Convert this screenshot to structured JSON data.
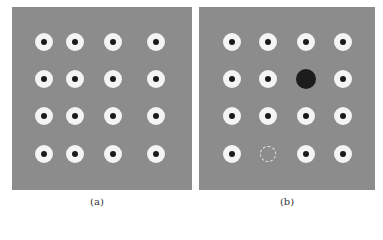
{
  "figure": {
    "panels": [
      {
        "id": "a",
        "caption": "(a)",
        "box": {
          "x": 12,
          "y": 7,
          "w": 180,
          "h": 183
        },
        "columns": [
          44,
          75,
          113,
          156
        ],
        "rows": [
          42,
          79,
          116,
          154
        ],
        "markers": "4x4 grid of white rings with black centers"
      },
      {
        "id": "b",
        "caption": "(b)",
        "box": {
          "x": 199,
          "y": 7,
          "w": 176,
          "h": 183
        },
        "columns": [
          232,
          268,
          306,
          343
        ],
        "rows": [
          42,
          79,
          116,
          154
        ],
        "markers": "4x4 grid with one enlarged black dot and one missing (dashed) marker",
        "enlarged_marker": {
          "row": 2,
          "col": 3,
          "cx": 306,
          "cy": 79,
          "r": 10,
          "color": "#1c1c1c"
        },
        "missing_marker": {
          "row": 4,
          "col": 2,
          "cx": 268,
          "cy": 154,
          "r": 8,
          "style": "dashed outline"
        }
      }
    ],
    "colors": {
      "background": "#8c8c8c",
      "ring": "#f4f4f4",
      "center": "#1a1a1a"
    }
  }
}
